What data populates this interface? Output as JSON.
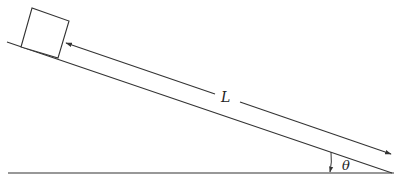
{
  "diagram": {
    "type": "inclined-plane",
    "labels": {
      "length": "L",
      "angle": "θ"
    },
    "colors": {
      "line": "#333333",
      "background": "#ffffff"
    }
  }
}
